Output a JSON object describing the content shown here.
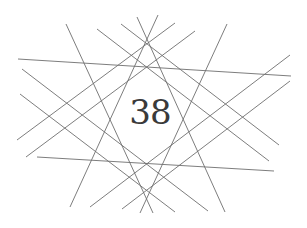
{
  "figure": {
    "center_label": "38",
    "line_color": "#6e6e6e",
    "text_color": "#3a3a3a",
    "lines": [
      {
        "x1": 18,
        "y1": 59,
        "x2": 291,
        "y2": 76
      },
      {
        "x1": 37,
        "y1": 157,
        "x2": 274,
        "y2": 171
      },
      {
        "x1": 66,
        "y1": 24,
        "x2": 153,
        "y2": 213
      },
      {
        "x1": 227,
        "y1": 24,
        "x2": 140,
        "y2": 213
      },
      {
        "x1": 137,
        "y1": 17,
        "x2": 225,
        "y2": 212
      },
      {
        "x1": 158,
        "y1": 15,
        "x2": 70,
        "y2": 207
      },
      {
        "x1": 17,
        "y1": 140,
        "x2": 175,
        "y2": 23
      },
      {
        "x1": 26,
        "y1": 157,
        "x2": 195,
        "y2": 31
      },
      {
        "x1": 22,
        "y1": 69,
        "x2": 208,
        "y2": 211
      },
      {
        "x1": 20,
        "y1": 94,
        "x2": 175,
        "y2": 212
      },
      {
        "x1": 97,
        "y1": 29,
        "x2": 269,
        "y2": 161
      },
      {
        "x1": 121,
        "y1": 24,
        "x2": 279,
        "y2": 145
      },
      {
        "x1": 290,
        "y1": 55,
        "x2": 90,
        "y2": 207
      },
      {
        "x1": 290,
        "y1": 81,
        "x2": 122,
        "y2": 209
      }
    ]
  }
}
